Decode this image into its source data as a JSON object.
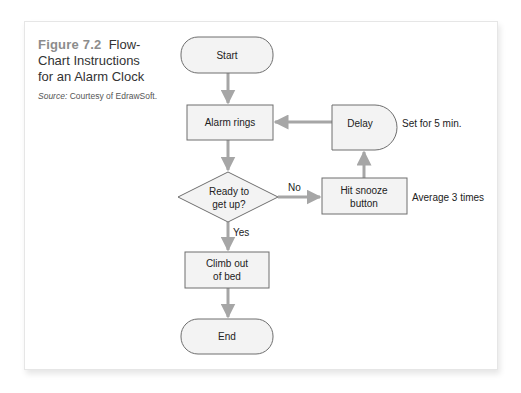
{
  "caption": {
    "figure_number": "Figure 7.2",
    "title": "Flow-Chart Instructions for an Alarm Clock",
    "source_label": "Source:",
    "source_text": "Courtesy of EdrawSoft."
  },
  "diagram": {
    "nodes": {
      "start": "Start",
      "alarm": "Alarm rings",
      "decision_line1": "Ready to",
      "decision_line2": "get up?",
      "snooze_line1": "Hit snooze",
      "snooze_line2": "button",
      "delay": "Delay",
      "climb_line1": "Climb out",
      "climb_line2": "of bed",
      "end": "End"
    },
    "edge_labels": {
      "no": "No",
      "yes": "Yes"
    },
    "notes": {
      "delay_note": "Set for 5 min.",
      "snooze_note": "Average 3 times"
    },
    "colors": {
      "node_fill": "#f3f3f3",
      "node_stroke": "#6e6e6e",
      "arrow": "#a6a6a6",
      "figure_number": "#8c8c8c"
    }
  }
}
